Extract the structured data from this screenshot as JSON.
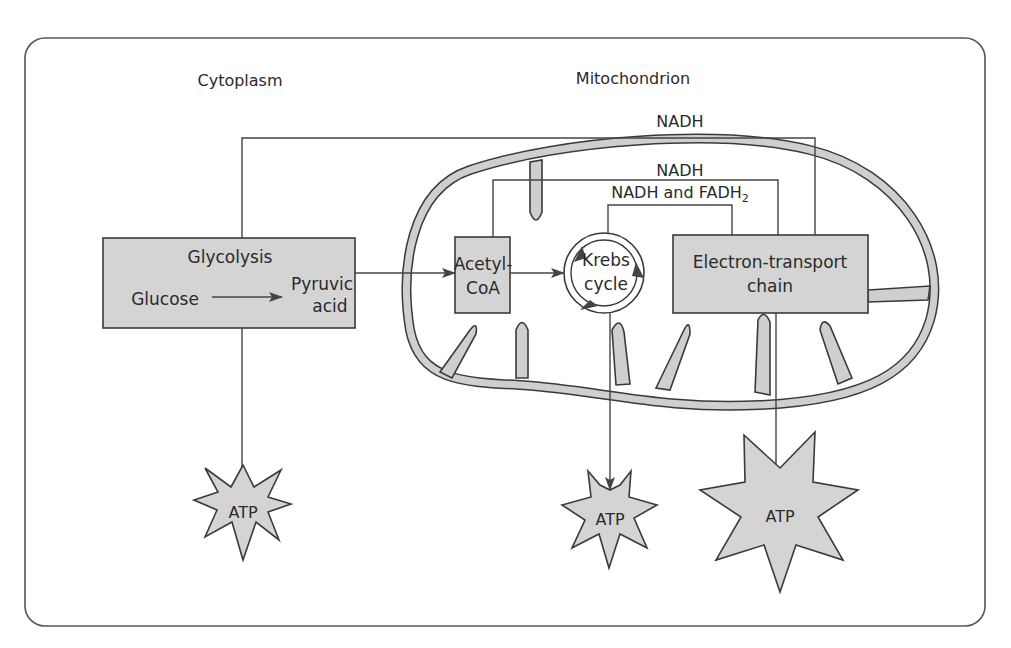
{
  "diagram": {
    "regions": {
      "cytoplasm": "Cytoplasm",
      "mitochondrion": "Mitochondrion"
    },
    "nodes": {
      "glycolysis": {
        "title": "Glycolysis",
        "input": "Glucose",
        "output_line1": "Pyruvic",
        "output_line2": "acid"
      },
      "acetyl_coa": {
        "line1": "Acetyl-",
        "line2": "CoA"
      },
      "krebs": {
        "line1": "Krebs",
        "line2": "cycle"
      },
      "etc": {
        "line1": "Electron-transport",
        "line2": "chain"
      }
    },
    "carriers": {
      "nadh_glycolysis": "NADH",
      "nadh_acetyl": "NADH",
      "nadh_fadh2_prefix": "NADH and FADH",
      "nadh_fadh2_sub": "2"
    },
    "outputs": {
      "atp_glycolysis": "ATP",
      "atp_krebs": "ATP",
      "atp_etc": "ATP"
    },
    "colors": {
      "fill": "#d4d4d4",
      "stroke": "#3a3a3a",
      "frame": "#555555",
      "background": "#ffffff"
    }
  }
}
